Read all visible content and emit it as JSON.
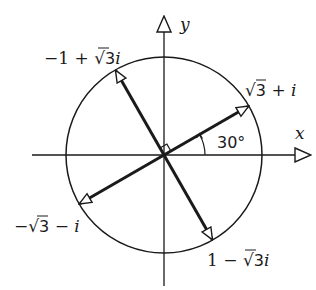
{
  "diagram": {
    "type": "complex-plane",
    "axes": {
      "x_label": "x",
      "y_label": "y"
    },
    "circle": {
      "center": [
        164,
        155
      ],
      "radius": 98
    },
    "angle_label": "30°",
    "right_angle_marker": true,
    "vectors": [
      {
        "name": "sqrt3-plus-i",
        "label_parts": [
          "√",
          "3",
          " + ",
          "i"
        ],
        "angle_deg": 30
      },
      {
        "name": "neg1-plus-sqrt3i",
        "label_parts": [
          "−1 + ",
          "√",
          "3",
          "i"
        ],
        "angle_deg": 120
      },
      {
        "name": "neg-sqrt3-minus-i",
        "label_parts": [
          "−",
          "√",
          "3",
          " − ",
          "i"
        ],
        "angle_deg": 210
      },
      {
        "name": "1-minus-sqrt3i",
        "label_parts": [
          "1 − ",
          "√",
          "3",
          "i"
        ],
        "angle_deg": 300
      }
    ],
    "labels": {
      "v1": {
        "a": "√",
        "b": "3",
        "c": " + ",
        "d": "i"
      },
      "v2": {
        "a": "−1 + ",
        "b": "√",
        "c": "3",
        "d": "i"
      },
      "v3": {
        "a": "−",
        "b": "√",
        "c": "3",
        "d": " − ",
        "e": "i"
      },
      "v4": {
        "a": "1 − ",
        "b": "√",
        "c": "3",
        "d": "i"
      }
    }
  }
}
